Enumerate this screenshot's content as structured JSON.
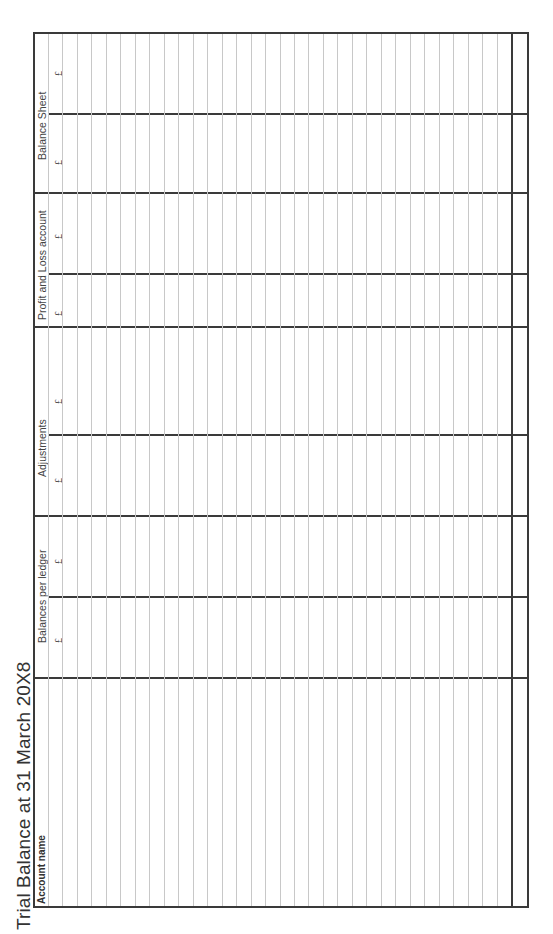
{
  "title": "Trial Balance at 31 March 20X8",
  "columns": {
    "account_name": "Account name",
    "groups": [
      {
        "label": "Balances per ledger",
        "sub": [
          "£",
          "£"
        ]
      },
      {
        "label": "Adjustments",
        "sub": [
          "£",
          "£"
        ]
      },
      {
        "label": "Profit and Loss account",
        "sub": [
          "£",
          "£"
        ]
      },
      {
        "label": "Balance Sheet",
        "sub": [
          "£",
          "£"
        ]
      }
    ]
  },
  "rows": {
    "count": 32,
    "values": []
  },
  "colors": {
    "border": "#3a3a3a",
    "gridline": "#c8c8c8",
    "text": "#444444"
  }
}
